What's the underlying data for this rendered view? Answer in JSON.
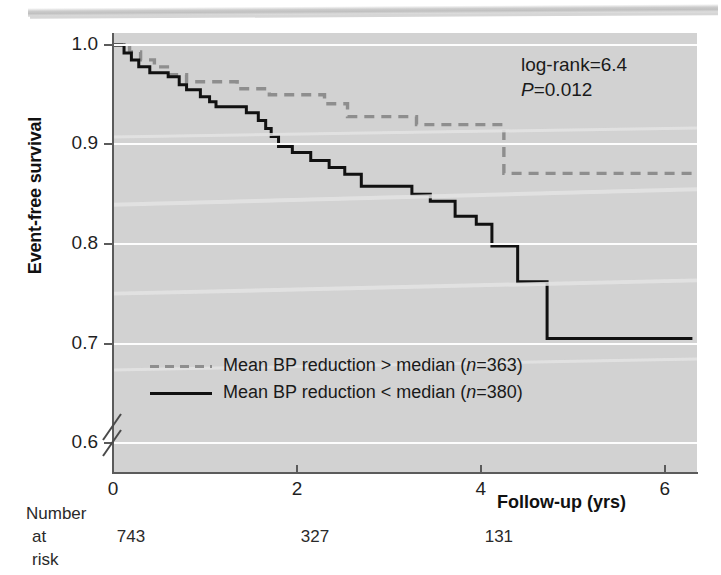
{
  "figure": {
    "type": "kaplan-meier-survival-plot",
    "panel_bg": "#d2d2d2",
    "axis_color": "#5b5b5b"
  },
  "axes": {
    "y_title": "Event-free survival",
    "x_title": "Follow-up (yrs)",
    "y_ticks": [
      "1.0",
      "0.9",
      "0.8",
      "0.7",
      "0.6"
    ],
    "x_ticks": [
      "0",
      "2",
      "4",
      "6"
    ],
    "y_axis_break": "//"
  },
  "annotation": {
    "logrank_label": "log-rank=6.4",
    "p_symbol": "P",
    "p_value_text": "=0.012"
  },
  "legend": {
    "items": [
      {
        "style": "dashed",
        "color": "#8e8e8e",
        "text_before": "Mean BP reduction > median (",
        "n_italic": "n",
        "text_after": "=363)"
      },
      {
        "style": "solid",
        "color": "#111111",
        "text_before": "Mean BP reduction < median (",
        "n_italic": "n",
        "text_after": "=380)"
      }
    ]
  },
  "risk_table": {
    "caption_line1": "Number",
    "caption_line2": "at risk",
    "values": [
      "743",
      "327",
      "131"
    ],
    "value_x_years": [
      0,
      2,
      4
    ]
  },
  "chart_data": {
    "type": "line",
    "subtype": "kaplan-meier step curves",
    "title": "",
    "xlabel": "Follow-up (yrs)",
    "ylabel": "Event-free survival",
    "xlim": [
      0,
      6.35
    ],
    "ylim": [
      0.57,
      1.012
    ],
    "grid": true,
    "gridlines_y": [
      1.0,
      0.9,
      0.8,
      0.7,
      0.6
    ],
    "xticks": [
      0,
      2,
      4,
      6
    ],
    "yticks": [
      1.0,
      0.9,
      0.8,
      0.7,
      0.6
    ],
    "legend_position": "inside-lower-left",
    "statistics": {
      "log_rank": 6.4,
      "p_value": 0.012
    },
    "n_at_risk": {
      "x": [
        0,
        2,
        4
      ],
      "n": [
        743,
        327,
        131
      ],
      "total": 743
    },
    "series": [
      {
        "name": "Mean BP reduction > median (n=363)",
        "n": 363,
        "style": "dashed",
        "color": "#8e8e8e",
        "points": [
          [
            0.0,
            1.0
          ],
          [
            0.18,
            1.0
          ],
          [
            0.18,
            0.993
          ],
          [
            0.3,
            0.993
          ],
          [
            0.3,
            0.985
          ],
          [
            0.45,
            0.985
          ],
          [
            0.45,
            0.978
          ],
          [
            0.62,
            0.978
          ],
          [
            0.62,
            0.97
          ],
          [
            0.8,
            0.97
          ],
          [
            0.8,
            0.963
          ],
          [
            1.35,
            0.963
          ],
          [
            1.35,
            0.956
          ],
          [
            1.7,
            0.956
          ],
          [
            1.7,
            0.95
          ],
          [
            2.3,
            0.95
          ],
          [
            2.3,
            0.941
          ],
          [
            2.55,
            0.941
          ],
          [
            2.55,
            0.928
          ],
          [
            3.3,
            0.928
          ],
          [
            3.3,
            0.92
          ],
          [
            4.25,
            0.92
          ],
          [
            4.25,
            0.871
          ],
          [
            6.3,
            0.871
          ]
        ]
      },
      {
        "name": "Mean BP reduction < median (n=380)",
        "n": 380,
        "style": "solid",
        "color": "#111111",
        "points": [
          [
            0.0,
            1.0
          ],
          [
            0.12,
            1.0
          ],
          [
            0.12,
            0.992
          ],
          [
            0.2,
            0.992
          ],
          [
            0.2,
            0.985
          ],
          [
            0.28,
            0.985
          ],
          [
            0.28,
            0.978
          ],
          [
            0.4,
            0.978
          ],
          [
            0.4,
            0.972
          ],
          [
            0.6,
            0.972
          ],
          [
            0.6,
            0.968
          ],
          [
            0.72,
            0.968
          ],
          [
            0.72,
            0.96
          ],
          [
            0.8,
            0.96
          ],
          [
            0.8,
            0.955
          ],
          [
            0.95,
            0.955
          ],
          [
            0.95,
            0.948
          ],
          [
            1.05,
            0.948
          ],
          [
            1.05,
            0.943
          ],
          [
            1.12,
            0.943
          ],
          [
            1.12,
            0.938
          ],
          [
            1.45,
            0.938
          ],
          [
            1.45,
            0.932
          ],
          [
            1.58,
            0.932
          ],
          [
            1.58,
            0.924
          ],
          [
            1.66,
            0.924
          ],
          [
            1.66,
            0.916
          ],
          [
            1.72,
            0.916
          ],
          [
            1.72,
            0.908
          ],
          [
            1.8,
            0.908
          ],
          [
            1.8,
            0.898
          ],
          [
            1.95,
            0.898
          ],
          [
            1.95,
            0.892
          ],
          [
            2.15,
            0.892
          ],
          [
            2.15,
            0.884
          ],
          [
            2.35,
            0.884
          ],
          [
            2.35,
            0.877
          ],
          [
            2.52,
            0.877
          ],
          [
            2.52,
            0.87
          ],
          [
            2.7,
            0.87
          ],
          [
            2.7,
            0.858
          ],
          [
            3.25,
            0.858
          ],
          [
            3.25,
            0.85
          ],
          [
            3.45,
            0.85
          ],
          [
            3.45,
            0.843
          ],
          [
            3.72,
            0.843
          ],
          [
            3.72,
            0.828
          ],
          [
            3.95,
            0.828
          ],
          [
            3.95,
            0.82
          ],
          [
            4.12,
            0.82
          ],
          [
            4.12,
            0.798
          ],
          [
            4.4,
            0.798
          ],
          [
            4.4,
            0.762
          ],
          [
            4.72,
            0.762
          ],
          [
            4.72,
            0.705
          ],
          [
            6.3,
            0.705
          ]
        ]
      }
    ]
  }
}
